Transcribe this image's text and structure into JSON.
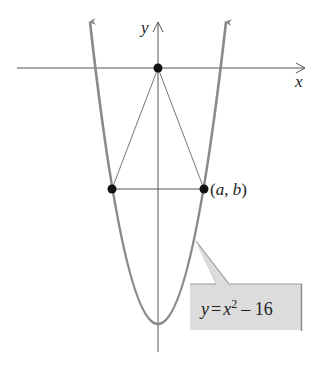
{
  "figure": {
    "type": "parabola-diagram",
    "axes": {
      "x_label": "x",
      "y_label": "y"
    },
    "curve": {
      "equation_parts": {
        "lhs": "y",
        "eq": "=",
        "base": "x",
        "exponent": "2",
        "rest": "– 16"
      },
      "color": "#8a8a8a"
    },
    "points": [
      {
        "name": "origin",
        "label": ""
      },
      {
        "name": "left-point",
        "label": ""
      },
      {
        "name": "right-point",
        "label": "(a, b)"
      }
    ],
    "point_label_parts": {
      "open": "(",
      "a": "a",
      "comma": ", ",
      "b": "b",
      "close": ")"
    },
    "callout": {
      "fill": "#dcdcdc",
      "edge": "#9a9a9a"
    }
  }
}
